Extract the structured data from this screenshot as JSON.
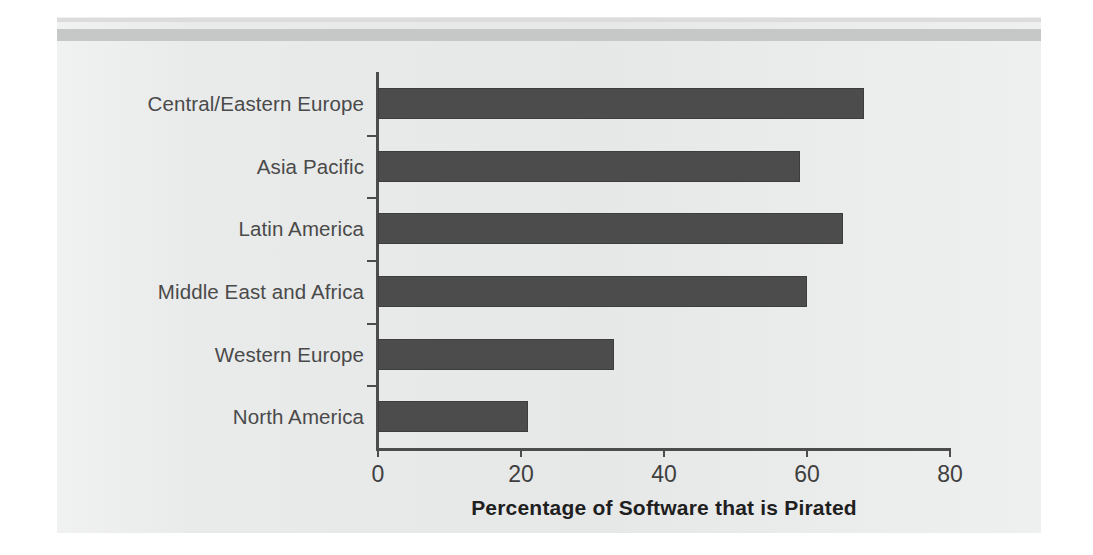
{
  "figure": {
    "background_color": "#ffffff",
    "panel_color": "#e9eaea",
    "rule_color": "#c6c7c7"
  },
  "chart_data": {
    "type": "bar",
    "orientation": "horizontal",
    "title": "",
    "subtitle": "",
    "xlabel": "Percentage of Software that is Pirated",
    "ylabel": "",
    "categories": [
      "Central/Eastern Europe",
      "Asia Pacific",
      "Latin America",
      "Middle East and Africa",
      "Western Europe",
      "North America"
    ],
    "values": [
      68,
      59,
      65,
      60,
      33,
      21
    ],
    "xlim": [
      0,
      80
    ],
    "xticks": [
      0,
      20,
      40,
      60,
      80
    ],
    "xticklabels": [
      "0",
      "20",
      "40",
      "60",
      "80"
    ],
    "grid": false,
    "legend": null,
    "bar_color": "#4c4c4c",
    "axis_color": "#4c4c4c"
  }
}
